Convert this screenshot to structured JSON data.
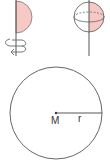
{
  "figure": {
    "colors": {
      "stroke": "#555555",
      "fill": "#f6c9c4",
      "background": "#ffffff"
    },
    "panels": [
      {
        "id": "semicircle-rotation",
        "caption": ""
      },
      {
        "id": "sphere",
        "caption": ""
      },
      {
        "id": "circle",
        "caption": ""
      }
    ],
    "labels": {
      "center": "M",
      "radius": "r"
    }
  }
}
